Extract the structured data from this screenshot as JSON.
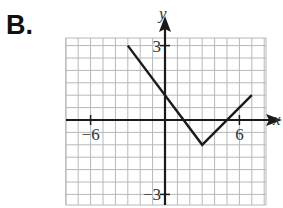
{
  "option_label": "B.",
  "chart_data": {
    "type": "line",
    "title": "",
    "xlabel": "x",
    "ylabel": "y",
    "xlim": [
      -8,
      8
    ],
    "ylim": [
      -3.5,
      3.5
    ],
    "grid": true,
    "x_ticks_labeled": [
      {
        "value": -6,
        "label": "−6"
      },
      {
        "value": 6,
        "label": "6"
      }
    ],
    "y_ticks_labeled": [
      {
        "value": 3,
        "label": "3"
      },
      {
        "value": -3,
        "label": "−3"
      }
    ],
    "grid_units": {
      "x_per_cell": 1,
      "y_per_cell": 0.5
    },
    "series": [
      {
        "name": "absolute-value graph",
        "x": [
          -3,
          3,
          7
        ],
        "y": [
          3,
          -1,
          1
        ]
      }
    ],
    "annotations": {
      "vertex": [
        3,
        -1
      ],
      "y_intercept": 1,
      "x_intercepts": [
        1.5,
        5
      ]
    },
    "colors": {
      "grid": "#b8b8b8",
      "axes": "#1a1a1a",
      "line": "#1a1a1a"
    }
  }
}
